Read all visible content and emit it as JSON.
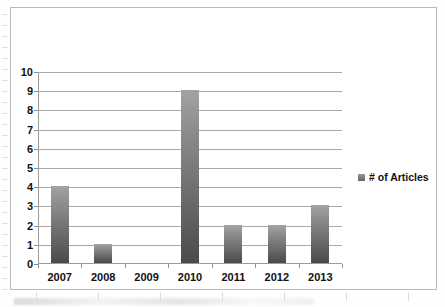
{
  "chart_data": {
    "type": "bar",
    "title": "",
    "xlabel": "",
    "ylabel": "",
    "categories": [
      "2007",
      "2008",
      "2009",
      "2010",
      "2011",
      "2012",
      "2013"
    ],
    "values": [
      4,
      1,
      0,
      9,
      2,
      2,
      3
    ],
    "series": [
      {
        "name": "# of Articles",
        "values": [
          4,
          1,
          0,
          9,
          2,
          2,
          3
        ]
      }
    ],
    "ylim": [
      0,
      10
    ],
    "y_ticks": [
      "10",
      "9",
      "8",
      "7",
      "6",
      "5",
      "4",
      "3",
      "2",
      "1",
      "0"
    ],
    "grid": "horizontal",
    "legend_position": "right",
    "legend_entries": [
      "# of Articles"
    ],
    "colors": {
      "bar_top": "#a3a3a3",
      "bar_bottom": "#4a4a4a",
      "gridline": "#a9a9a9",
      "axis": "#9a9a9a",
      "text": "#111111",
      "border": "#b9b9b9",
      "background": "#ffffff"
    }
  }
}
